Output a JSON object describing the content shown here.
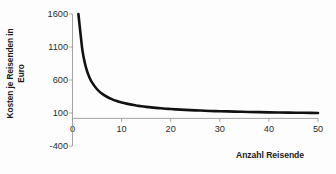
{
  "chart_data": {
    "type": "line",
    "title": "",
    "xlabel": "Anzahl Reisende",
    "ylabel": "Kosten je Reisenden in Euro",
    "ylabel_line1": "Kosten je Reisenden in",
    "ylabel_line2": "Euro",
    "xlim": [
      0,
      50
    ],
    "ylim": [
      -400,
      1600
    ],
    "xticks": [
      0,
      10,
      20,
      30,
      40,
      50
    ],
    "xtick_labels": [
      "0",
      "10",
      "20",
      "30",
      "40",
      "50"
    ],
    "yticks": [
      -400,
      100,
      600,
      1100,
      1600
    ],
    "ytick_labels": [
      "-400",
      "100",
      "600",
      "1100",
      "1600"
    ],
    "grid": false,
    "legend": null,
    "series": [
      {
        "name": "Kosten je Reisenden",
        "color": "#111111",
        "x": [
          1.2,
          1.5,
          2,
          2.5,
          3,
          3.5,
          4,
          5,
          6,
          7,
          8,
          9,
          10,
          11,
          12,
          13,
          14,
          15,
          16,
          17,
          18,
          19,
          20,
          22,
          24,
          26,
          28,
          30,
          33,
          36,
          40,
          44,
          47,
          50
        ],
        "y": [
          1600,
          1393,
          1060,
          860,
          727,
          631,
          560,
          460,
          393,
          346,
          310,
          282,
          260,
          242,
          227,
          214,
          203,
          193,
          185,
          178,
          171,
          165,
          160,
          151,
          143,
          137,
          131,
          127,
          121,
          116,
          110,
          105,
          103,
          100
        ]
      }
    ],
    "annotations": []
  },
  "axis": {
    "x_title": "Anzahl Reisende",
    "y_title_line1": "Kosten je Reisenden in",
    "y_title_line2": "Euro",
    "y_labels": [
      "1600",
      "1100",
      "600",
      "100",
      "-400"
    ],
    "x_labels": [
      "0",
      "10",
      "20",
      "30",
      "40",
      "50"
    ]
  },
  "colors": {
    "curve": "#111111",
    "axis": "#9a9a9a",
    "tick_text": "#2b2b2b",
    "title_text": "#1a1a1a",
    "background": "#fdfdfd"
  }
}
